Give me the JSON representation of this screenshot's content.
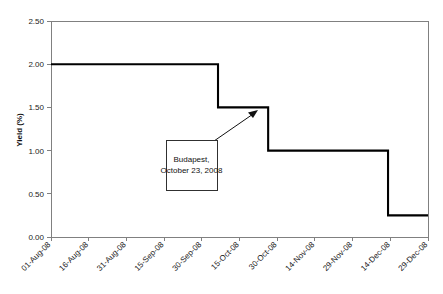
{
  "chart_data": {
    "type": "line",
    "line_style": "step-post",
    "title": "",
    "xlabel": "",
    "ylabel": "Yield (%)",
    "ylim": [
      0.0,
      2.5
    ],
    "ytick_labels": [
      "0.00",
      "0.50",
      "1.00",
      "1.50",
      "2.00",
      "2.50"
    ],
    "ytick_values": [
      0.0,
      0.5,
      1.0,
      1.5,
      2.0,
      2.5
    ],
    "xtick_labels": [
      "01-Aug-08",
      "16-Aug-08",
      "31-Aug-08",
      "15-Sep-08",
      "30-Sep-08",
      "15-Oct-08",
      "30-Oct-08",
      "14-Nov-08",
      "29-Nov-08",
      "14-Dec-08",
      "29-Dec-08"
    ],
    "grid": false,
    "legend": false,
    "series": [
      {
        "name": "Yield",
        "color": "#000000",
        "steps": [
          {
            "x_label": "01-Aug-08",
            "x_frac": 0.0,
            "value": 2.0
          },
          {
            "x_label": "08-Oct-08",
            "x_frac": 0.443,
            "value": 1.5
          },
          {
            "x_label": "28-Oct-08",
            "x_frac": 0.576,
            "value": 1.0
          },
          {
            "x_label": "16-Dec-08",
            "x_frac": 0.894,
            "value": 0.25
          },
          {
            "x_label": "29-Dec-08",
            "x_frac": 1.0,
            "value": 0.25
          }
        ]
      }
    ],
    "annotations": [
      {
        "name": "budapest-annotation",
        "text_lines": [
          "Budapest,",
          "October 23, 2008"
        ],
        "points_to_value": 1.5,
        "points_to_x_label": "23-Oct-08"
      }
    ]
  },
  "colors": {
    "line": "#000000",
    "axis": "#808080",
    "text": "#111111",
    "background": "#ffffff"
  }
}
